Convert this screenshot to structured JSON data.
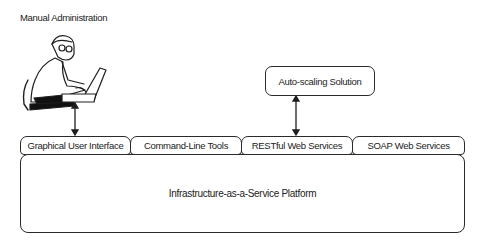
{
  "diagram": {
    "manual_admin_label": "Manual Administration",
    "autoscaling_label": "Auto-scaling Solution",
    "interfaces": [
      {
        "label": "Graphical User Interface"
      },
      {
        "label": "Command-Line Tools"
      },
      {
        "label": "RESTful Web Services"
      },
      {
        "label": "SOAP Web Services"
      }
    ],
    "platform_label": "Infrastructure-as-a-Service Platform",
    "icons": {
      "admin": "person-at-laptop-icon",
      "arrows": "bidirectional-arrow-icon"
    },
    "colors": {
      "stroke": "#2a2a2a",
      "background": "#ffffff"
    }
  }
}
